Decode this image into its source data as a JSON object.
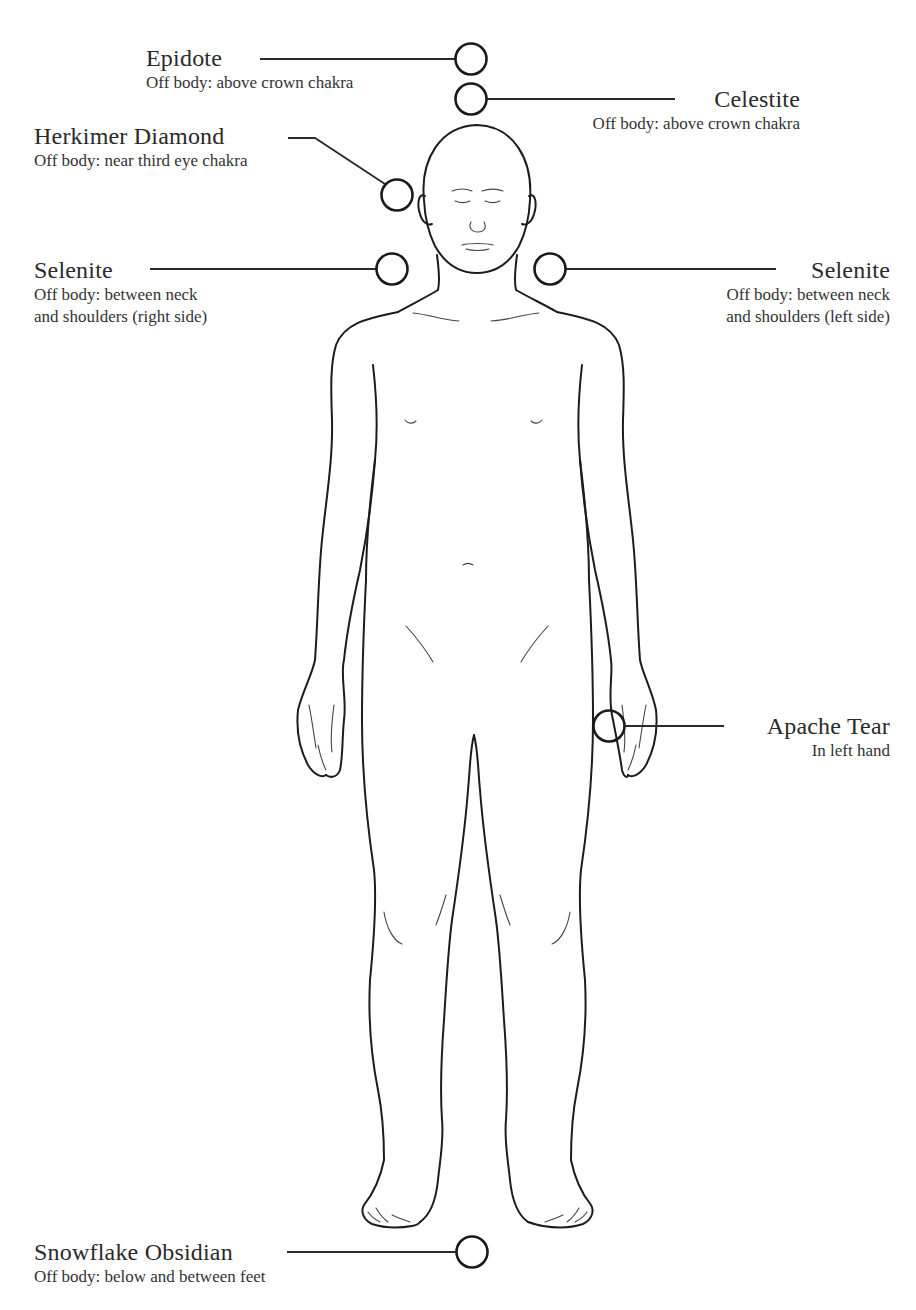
{
  "diagram": {
    "type": "crystal-body-layout",
    "figure": "front-facing human body outline",
    "placements": [
      {
        "id": "epidote",
        "name": "Epidote",
        "description": "Off body: above crown chakra",
        "side": "left",
        "marker": {
          "x": 471,
          "y": 59
        }
      },
      {
        "id": "celestite",
        "name": "Celestite",
        "description": "Off body: above crown chakra",
        "side": "right",
        "marker": {
          "x": 471,
          "y": 99
        }
      },
      {
        "id": "herkimer-diamond",
        "name": "Herkimer Diamond",
        "description": "Off body: near third eye chakra",
        "side": "left",
        "marker": {
          "x": 397,
          "y": 195
        }
      },
      {
        "id": "selenite-right",
        "name": "Selenite",
        "description_line1": "Off body: between neck",
        "description_line2": "and shoulders (right side)",
        "side": "left",
        "marker": {
          "x": 392,
          "y": 269
        }
      },
      {
        "id": "selenite-left",
        "name": "Selenite",
        "description_line1": "Off body: between neck",
        "description_line2": "and shoulders (left side)",
        "side": "right",
        "marker": {
          "x": 550,
          "y": 269
        }
      },
      {
        "id": "apache-tear",
        "name": "Apache Tear",
        "description": "In left hand",
        "side": "right",
        "marker": {
          "x": 609,
          "y": 726
        }
      },
      {
        "id": "snowflake-obsidian",
        "name": "Snowflake Obsidian",
        "description": "Off body: below and between feet",
        "side": "left",
        "marker": {
          "x": 472,
          "y": 1252
        }
      }
    ],
    "colors": {
      "line": "#1c1c1c",
      "text": "#2b2b2b",
      "background": "#ffffff"
    }
  }
}
